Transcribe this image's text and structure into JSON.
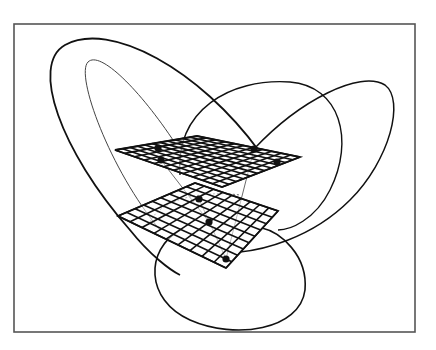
{
  "figure": {
    "width": 436,
    "height": 350,
    "background": "#ffffff",
    "frame": {
      "x": 14,
      "y": 24,
      "w": 401,
      "h": 308,
      "stroke": "#555555",
      "stroke_width": 1.6
    },
    "ink": "#111111",
    "faint_ink": "#444444"
  },
  "planes": [
    {
      "name": "upper-plane",
      "corners": [
        [
          115,
          150
        ],
        [
          197,
          136
        ],
        [
          300,
          157
        ],
        [
          222,
          187
        ]
      ],
      "divisions": 11,
      "markers": [
        [
          158,
          148
        ],
        [
          161,
          160
        ],
        [
          254,
          149
        ],
        [
          277,
          162
        ]
      ]
    },
    {
      "name": "lower-plane",
      "corners": [
        [
          118,
          216
        ],
        [
          195,
          183
        ],
        [
          278,
          211
        ],
        [
          226,
          268
        ]
      ],
      "divisions": 9,
      "markers": [
        [
          199,
          199
        ],
        [
          209,
          222
        ],
        [
          226,
          259
        ]
      ]
    }
  ],
  "curves": [
    {
      "name": "outer-left-loop",
      "d": "M 259 151 C 200 70, 110 20, 65 45 C 30 65, 60 150, 130 230 C 150 255, 170 270, 180 275",
      "width": 1.8
    },
    {
      "name": "inner-left-loop",
      "d": "M 175 143 C 140 90, 100 50, 88 62 C 75 75, 110 170, 160 230",
      "width": 1.0
    },
    {
      "name": "middle-right-loop",
      "d": "M 180 175 C 175 110, 230 78, 290 82 C 340 86, 355 140, 330 190 C 315 220, 290 230, 278 230",
      "width": 1.4
    },
    {
      "name": "far-right-loop",
      "d": "M 254 149 C 300 100, 360 70, 385 85 C 405 100, 390 160, 350 200 C 310 240, 260 250, 240 252",
      "width": 1.5
    },
    {
      "name": "bottom-loop",
      "d": "M 180 230 C 145 250, 145 300, 190 320 C 235 340, 300 330, 305 290 C 308 255, 280 232, 262 228",
      "width": 1.6
    },
    {
      "name": "dotted-arc",
      "d": "M 150 222 C 160 200, 200 190, 240 195",
      "width": 0.8,
      "dash": "2 2"
    },
    {
      "name": "connector-a",
      "d": "M 161 160 L 209 222",
      "width": 0.8
    },
    {
      "name": "connector-b",
      "d": "M 254 149 L 226 259",
      "width": 0.8
    },
    {
      "name": "connector-c",
      "d": "M 199 199 L 226 259",
      "width": 0.8
    }
  ]
}
